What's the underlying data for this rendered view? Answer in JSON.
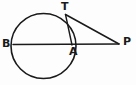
{
  "figure": {
    "background_color": "#fdfdfd",
    "stroke_color": "#1a1a1a",
    "label_color": "#1a1a1a"
  },
  "labels": {
    "B": "B",
    "T": "T",
    "A": "A",
    "P": "P"
  },
  "chart_data": {
    "type": "diagram",
    "shapes": [
      {
        "name": "circle",
        "kind": "circle",
        "cx": 43.5,
        "cy": 46,
        "r": 32.5,
        "stroke": "#1a1a1a",
        "stroke_width": 1.6,
        "fill": "none"
      },
      {
        "name": "secant-line-BP",
        "kind": "line",
        "from": "B",
        "to": "P",
        "x1": 13,
        "y1": 44.5,
        "x2": 119,
        "y2": 44,
        "stroke": "#1a1a1a",
        "stroke_width": 1.5
      },
      {
        "name": "tangent-line-TP",
        "kind": "line",
        "from": "T",
        "to": "P",
        "x1": 65.5,
        "y1": 14.5,
        "x2": 119,
        "y2": 44,
        "stroke": "#1a1a1a",
        "stroke_width": 1.5
      },
      {
        "name": "chord-TA",
        "kind": "line",
        "from": "T",
        "to": "A",
        "x1": 65.5,
        "y1": 14.5,
        "x2": 72,
        "y2": 45,
        "stroke": "#1a1a1a",
        "stroke_width": 1.4
      }
    ],
    "points": [
      {
        "name": "B",
        "label": "B",
        "x": 13,
        "y": 44.5,
        "note": "left end of diameter on circle"
      },
      {
        "name": "A",
        "label": "A",
        "x": 72,
        "y": 45,
        "note": "right end of diameter on circle"
      },
      {
        "name": "T",
        "label": "T",
        "x": 65.5,
        "y": 14.5,
        "note": "point of tangency on circle"
      },
      {
        "name": "P",
        "label": "P",
        "x": 119,
        "y": 44,
        "note": "external point, meeting of tangent and secant"
      }
    ]
  }
}
